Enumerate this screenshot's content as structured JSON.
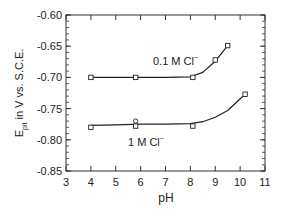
{
  "chart_data": {
    "type": "line",
    "title": "",
    "xlabel": "pH",
    "ylabel": "E_pit in V vs. S.C.E.",
    "ylabel_main": "E",
    "ylabel_sub": "pit",
    "ylabel_rest": " in V vs. S.C.E.",
    "xlim": [
      3,
      11
    ],
    "ylim": [
      -0.85,
      -0.6
    ],
    "x_ticks": [
      3,
      4,
      5,
      6,
      7,
      8,
      9,
      10,
      11
    ],
    "x_tick_labels": [
      "3",
      "4",
      "5",
      "6",
      "7",
      "8",
      "9",
      "10",
      "11"
    ],
    "y_ticks": [
      -0.6,
      -0.65,
      -0.7,
      -0.75,
      -0.8,
      -0.85
    ],
    "y_tick_labels": [
      "-0.60",
      "-0.65",
      "-0.70",
      "-0.75",
      "-0.80",
      "-0.85"
    ],
    "grid": false,
    "legend": "inline annotations",
    "series": [
      {
        "name": "0.1 M Cl⁻",
        "label": "0.1 M Cl",
        "label_sup": "−",
        "marker": "square",
        "x": [
          4.0,
          5.8,
          8.1,
          9.0,
          9.5
        ],
        "values": [
          -0.7,
          -0.7,
          -0.7,
          -0.672,
          -0.649
        ]
      },
      {
        "name": "1 M Cl⁻",
        "label": "1 M Cl",
        "label_sup": "−",
        "marker": "circle/square",
        "x": [
          4.0,
          5.8,
          5.8,
          8.1,
          10.2
        ],
        "values": [
          -0.78,
          -0.77,
          -0.778,
          -0.778,
          -0.727
        ]
      }
    ],
    "curves": [
      {
        "name": "0.1 M Cl⁻ fit",
        "x": [
          4.0,
          5.0,
          6.0,
          7.0,
          8.0,
          8.5,
          9.0,
          9.5
        ],
        "values": [
          -0.7,
          -0.7,
          -0.7,
          -0.7,
          -0.699,
          -0.692,
          -0.674,
          -0.649
        ]
      },
      {
        "name": "1 M Cl⁻ fit",
        "x": [
          4.0,
          5.0,
          6.0,
          7.0,
          8.0,
          8.5,
          9.0,
          9.5,
          10.2
        ],
        "values": [
          -0.777,
          -0.776,
          -0.775,
          -0.775,
          -0.774,
          -0.771,
          -0.764,
          -0.753,
          -0.727
        ]
      }
    ]
  },
  "colors": {
    "axis": "#333333",
    "line": "#222222",
    "background": "#ffffff"
  }
}
